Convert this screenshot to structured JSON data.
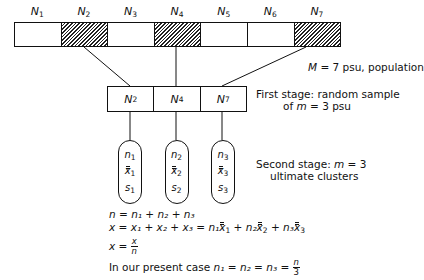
{
  "population": {
    "labels": [
      {
        "base": "N",
        "sub": "1"
      },
      {
        "base": "N",
        "sub": "2"
      },
      {
        "base": "N",
        "sub": "3"
      },
      {
        "base": "N",
        "sub": "4"
      },
      {
        "base": "N",
        "sub": "5"
      },
      {
        "base": "N",
        "sub": "6"
      },
      {
        "base": "N",
        "sub": "7"
      }
    ],
    "sampled_indices": [
      2,
      4,
      7
    ],
    "caption_var": "M",
    "caption_rest": " = 7 psu, population"
  },
  "first_stage": {
    "labels": [
      {
        "base": "N",
        "sub": "2"
      },
      {
        "base": "N",
        "sub": "4"
      },
      {
        "base": "N",
        "sub": "7"
      }
    ],
    "caption_line1": "First stage: random sample",
    "caption_line2_pre": "of ",
    "caption_line2_var": "m",
    "caption_line2_post": " = 3 psu"
  },
  "second_stage": {
    "clusters": [
      {
        "n": "n",
        "x": "x",
        "s": "s",
        "sub": "1"
      },
      {
        "n": "n",
        "x": "x",
        "s": "s",
        "sub": "2"
      },
      {
        "n": "n",
        "x": "x",
        "s": "s",
        "sub": "3"
      }
    ],
    "caption_line1_pre": "Second stage: ",
    "caption_line1_var": "m",
    "caption_line1_post": " = 3",
    "caption_line2": "ultimate clusters"
  },
  "formulas": {
    "line1": "n = n₁ + n₂ + n₃",
    "line2_lhs": "x = x₁ + x₂ + x₃ = ",
    "line2_terms": [
      "n₁",
      "n₂",
      "n₃"
    ],
    "line3_lhs": "x = ",
    "line3_num": "x",
    "line3_den": "n",
    "line4_text": "In our present case ",
    "line4_eq": "n₁ = n₂ = n₃ = ",
    "line4_num": "n",
    "line4_den": "3"
  }
}
